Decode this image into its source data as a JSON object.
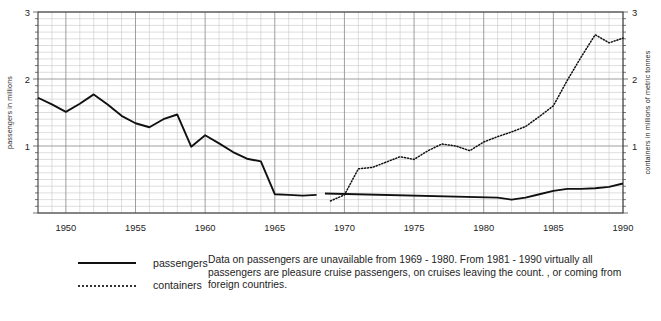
{
  "chart_data": {
    "type": "line",
    "title": "",
    "xlabel": "",
    "ylabel": "passengers in millions",
    "y2label": "containers in millions of metric tonnes",
    "xlim": [
      1948,
      1990
    ],
    "ylim": [
      0,
      3
    ],
    "y2lim": [
      0,
      3
    ],
    "yticks": [
      1,
      2,
      3
    ],
    "y2ticks": [
      1,
      2,
      3
    ],
    "xticks": [
      1950,
      1955,
      1960,
      1965,
      1970,
      1975,
      1980,
      1985,
      1990
    ],
    "grid": true,
    "grid_minor_per_unit": 10,
    "legend_position": "below-left",
    "series": [
      {
        "name": "passengers",
        "style": "solid",
        "axis": "left",
        "units": "millions",
        "x": [
          1948,
          1949,
          1950,
          1951,
          1952,
          1953,
          1954,
          1955,
          1956,
          1957,
          1958,
          1959,
          1960,
          1961,
          1962,
          1963,
          1964,
          1965,
          1966,
          1967,
          1968
        ],
        "values": [
          1.72,
          1.62,
          1.51,
          1.63,
          1.77,
          1.62,
          1.45,
          1.34,
          1.28,
          1.4,
          1.47,
          0.99,
          1.16,
          1.04,
          0.91,
          0.81,
          0.77,
          0.28,
          0.27,
          0.26,
          0.27
        ]
      },
      {
        "name": "passengers",
        "style": "solid",
        "axis": "left",
        "units": "millions",
        "segment": "1981-1990",
        "x": [
          1968.6,
          1981,
          1982,
          1983,
          1984,
          1985,
          1986,
          1987,
          1988,
          1989,
          1990
        ],
        "values": [
          0.29,
          0.23,
          0.2,
          0.23,
          0.28,
          0.33,
          0.36,
          0.36,
          0.37,
          0.39,
          0.44
        ]
      },
      {
        "name": "containers",
        "style": "dotted",
        "axis": "right",
        "units": "millions of metric tonnes",
        "x": [
          1969,
          1970,
          1971,
          1972,
          1973,
          1974,
          1975,
          1976,
          1977,
          1978,
          1979,
          1980,
          1981,
          1982,
          1983,
          1984,
          1985,
          1986,
          1987,
          1988,
          1989,
          1990
        ],
        "values": [
          0.18,
          0.27,
          0.66,
          0.68,
          0.76,
          0.84,
          0.8,
          0.93,
          1.03,
          1.0,
          0.93,
          1.06,
          1.14,
          1.21,
          1.29,
          1.44,
          1.6,
          1.98,
          2.33,
          2.66,
          2.54,
          2.61
        ]
      }
    ],
    "annotation": "Data on passengers are unavailable from 1969 - 1980.  From 1981 - 1990 virtually all passengers are pleasure cruise passengers, on cruises leaving the count. , or coming from foreign countries."
  },
  "axes": {
    "left_title": "passengers in millions",
    "right_title": "containers in millions of metric tonnes",
    "y_ticks": [
      "1",
      "2",
      "3"
    ],
    "y2_ticks": [
      "1",
      "2",
      "3"
    ],
    "x_ticks": [
      "1950",
      "1955",
      "1960",
      "1965",
      "1970",
      "1975",
      "1980",
      "1985",
      "1990"
    ]
  },
  "legend": {
    "items": [
      {
        "label": "passengers",
        "style": "solid"
      },
      {
        "label": "containers",
        "style": "dotted"
      }
    ]
  },
  "note": {
    "text": "Data on passengers are unavailable from 1969 - 1980.  From 1981 - 1990 virtually all passengers are pleasure cruise passengers, on cruises leaving the count. , or coming from foreign countries."
  },
  "colors": {
    "series_line": "#111111",
    "grid_major": "#8e8e8e",
    "grid_minor": "#c2c2c2",
    "axis": "#3a3a3a",
    "text": "#1d1d1d",
    "background": "#ffffff"
  }
}
